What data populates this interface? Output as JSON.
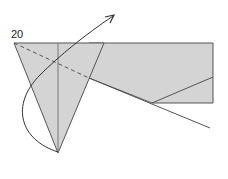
{
  "diagram": {
    "step_number": "20",
    "type": "origami fold step",
    "colors": {
      "paper_fill": "#d4d4d4",
      "line": "#555555",
      "arrow": "#333333"
    },
    "elements": [
      "shaded folded paper shape",
      "dashed valley-fold line",
      "curved fold arrow",
      "crease lines"
    ]
  }
}
